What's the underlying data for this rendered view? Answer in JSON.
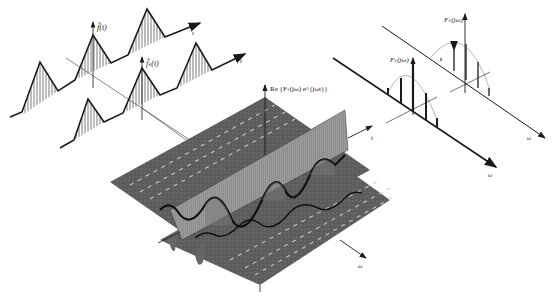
{
  "diagram": {
    "type": "3d-time-frequency-illustration",
    "left_panel": {
      "description": "Periodic and truncated time signals with triangular pulses",
      "signal_top_label": "f̃(t)",
      "signal_bottom_label": "f̃ₛ(t)",
      "time_axis_label": "t",
      "pulse_count_top": 3,
      "pulse_count_bottom": 3
    },
    "right_panel": {
      "description": "Line spectra of the periodic signals",
      "spectrum_top_label": "Fₛ(jω)",
      "spectrum_bottom_label": "Fₛ(jω)",
      "freq_axis_label": "ω"
    },
    "center_panel": {
      "description": "3D surface of real part of short-time Fourier transform",
      "z_axis_label": "Re {Fₛ(jω) e^{jωt}}",
      "time_axis_label": "t",
      "freq_axis_label": "ω"
    },
    "colors": {
      "ink": "#1a1a1a",
      "surface": "#5a5a5a",
      "surface_light": "#8a8a8a",
      "background": "#ffffff"
    }
  }
}
